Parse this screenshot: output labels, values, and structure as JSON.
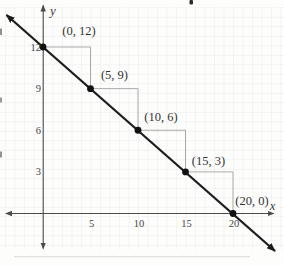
{
  "chart_data": {
    "type": "line",
    "title": "",
    "xlabel": "x",
    "ylabel": "y",
    "points": [
      {
        "x": 0,
        "y": 12,
        "label": "(0, 12)"
      },
      {
        "x": 5,
        "y": 9,
        "label": "(5, 9)"
      },
      {
        "x": 10,
        "y": 6,
        "label": "(10, 6)"
      },
      {
        "x": 15,
        "y": 3,
        "label": "(15, 3)"
      },
      {
        "x": 20,
        "y": 0,
        "label": "(20, 0)"
      }
    ],
    "x_ticks": [
      5,
      10,
      15,
      20
    ],
    "y_ticks": [
      12,
      9,
      6,
      3
    ],
    "xlim": [
      -4.3,
      25.4
    ],
    "ylim": [
      -2.7,
      15.3
    ],
    "grid": true,
    "legend_position": "none",
    "slope_steps": {
      "shown": true,
      "run": 5,
      "rise": -3
    },
    "colors": {
      "line": "#1d1d1d",
      "point": "#121212",
      "step_line": "#a9abab",
      "axis": "#4c4c4c",
      "label_text": "#333333",
      "tick_text": "#474747",
      "grid": "#e7e9e9",
      "background": "#fdfdfc"
    }
  }
}
